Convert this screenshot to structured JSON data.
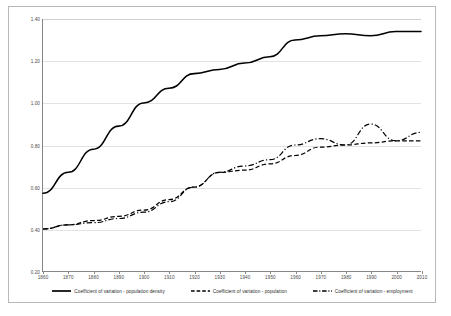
{
  "chart_data": {
    "type": "line",
    "title": "",
    "subtitle": "",
    "xlabel": "",
    "ylabel": "",
    "xlim": [
      1860,
      2010
    ],
    "ylim": [
      0.2,
      1.4
    ],
    "grid": true,
    "legend_position": "bottom",
    "x": [
      1860,
      1870,
      1880,
      1890,
      1900,
      1910,
      1920,
      1930,
      1940,
      1950,
      1960,
      1970,
      1980,
      1990,
      2000,
      2010
    ],
    "xticks": [
      "1860",
      "1870",
      "1880",
      "1890",
      "1900",
      "1910",
      "1920",
      "1930",
      "1940",
      "1950",
      "1960",
      "1970",
      "1980",
      "1990",
      "2000",
      "2010"
    ],
    "yticks": [
      "0.20",
      "0.40",
      "0.60",
      "0.80",
      "1.00",
      "1.20",
      "1.40"
    ],
    "ytick_values": [
      0.2,
      0.4,
      0.6,
      0.8,
      1.0,
      1.2,
      1.4
    ],
    "series": [
      {
        "name": "Coefficient of variation - population density",
        "style": "solid",
        "color": "#000000",
        "values": [
          0.57,
          0.67,
          0.78,
          0.89,
          1.0,
          1.07,
          1.14,
          1.16,
          1.19,
          1.22,
          1.3,
          1.32,
          1.33,
          1.32,
          1.34,
          1.34
        ]
      },
      {
        "name": "Coefficient of variation - population",
        "style": "dashed",
        "color": "#000000",
        "values": [
          0.4,
          0.42,
          0.44,
          0.46,
          0.49,
          0.54,
          0.6,
          0.67,
          0.68,
          0.71,
          0.75,
          0.79,
          0.8,
          0.81,
          0.82,
          0.82
        ]
      },
      {
        "name": "Coefficient of variation - employment",
        "style": "dashdot",
        "color": "#000000",
        "values": [
          0.4,
          0.42,
          0.43,
          0.45,
          0.48,
          0.53,
          0.6,
          0.67,
          0.7,
          0.73,
          0.8,
          0.83,
          0.8,
          0.9,
          0.82,
          0.86
        ]
      }
    ],
    "partial_series_note": ""
  },
  "legend": {
    "items": [
      {
        "label": "Coefficient of variation - population density",
        "style": "solid"
      },
      {
        "label": "Coefficient of variation - population",
        "style": "dashed"
      },
      {
        "label": "Coefficient of variation - employment",
        "style": "dashdot"
      }
    ]
  },
  "colors": {
    "line": "#000000",
    "grid": "#e2e2e2",
    "axis": "#868686",
    "frame": "#b9b9b9",
    "tick_text": "#4a4a4a"
  }
}
